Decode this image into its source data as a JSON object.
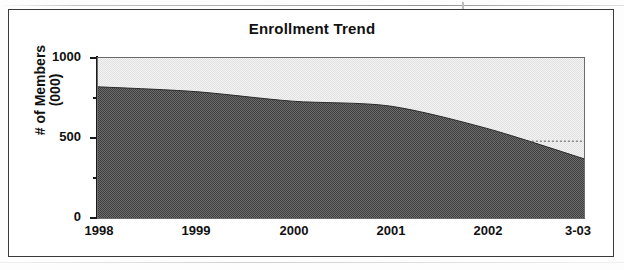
{
  "chart_data": {
    "type": "area",
    "title": "Enrollment Trend",
    "xlabel": "",
    "ylabel": "# of Members (000)",
    "ylabel_line1": "# of Members",
    "ylabel_line2": "(000)",
    "categories": [
      "1998",
      "1999",
      "2000",
      "2001",
      "2002",
      "3-03"
    ],
    "x": [
      1998,
      1999,
      2000,
      2001,
      2002,
      2003.25
    ],
    "values": [
      820,
      790,
      730,
      700,
      560,
      370
    ],
    "series": [
      {
        "name": "# of Members (000)",
        "values": [
          820,
          790,
          730,
          700,
          560,
          370
        ]
      }
    ],
    "ylim": [
      0,
      1000
    ],
    "yticks": [
      0,
      500,
      1000
    ],
    "ytick_labels": [
      "0",
      "500",
      "1000"
    ],
    "yminor_ticks": [
      250,
      750
    ],
    "xtick_labels": [
      "1998",
      "1999",
      "2000",
      "2001",
      "2002",
      "3-03"
    ],
    "grid": false,
    "legend": "none",
    "annotations": [
      {
        "type": "reference-line",
        "style": "dotted",
        "value": 480,
        "x_start": 2001.6,
        "x_end": 2003.25,
        "label": ""
      }
    ],
    "colors": {
      "area_fill": "#5a5a5a",
      "plot_background": "#eeeeee",
      "axis": "#1a1a1a",
      "title": "#111111",
      "frame": "#3a3a3a"
    }
  }
}
